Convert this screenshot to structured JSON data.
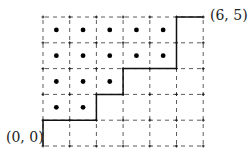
{
  "diagram": {
    "type": "lattice-path",
    "grid": {
      "cols": 6,
      "rows": 5
    },
    "labels": {
      "start": "(0, 0)",
      "end": "(6, 5)"
    },
    "path": [
      [
        0,
        0
      ],
      [
        0,
        1
      ],
      [
        2,
        1
      ],
      [
        2,
        2
      ],
      [
        3,
        2
      ],
      [
        3,
        3
      ],
      [
        5,
        3
      ],
      [
        5,
        5
      ],
      [
        6,
        5
      ]
    ],
    "dots": [
      [
        0.5,
        4.5
      ],
      [
        1.5,
        4.5
      ],
      [
        2.5,
        4.5
      ],
      [
        3.5,
        4.5
      ],
      [
        4.5,
        4.5
      ],
      [
        0.5,
        3.5
      ],
      [
        1.5,
        3.5
      ],
      [
        2.5,
        3.5
      ],
      [
        3.5,
        3.5
      ],
      [
        4.5,
        3.5
      ],
      [
        0.5,
        2.5
      ],
      [
        1.5,
        2.5
      ],
      [
        2.5,
        2.5
      ],
      [
        0.5,
        1.5
      ],
      [
        1.5,
        1.5
      ]
    ],
    "colors": {
      "grid": "#333333",
      "path": "#111111",
      "dot": "#000000"
    }
  }
}
